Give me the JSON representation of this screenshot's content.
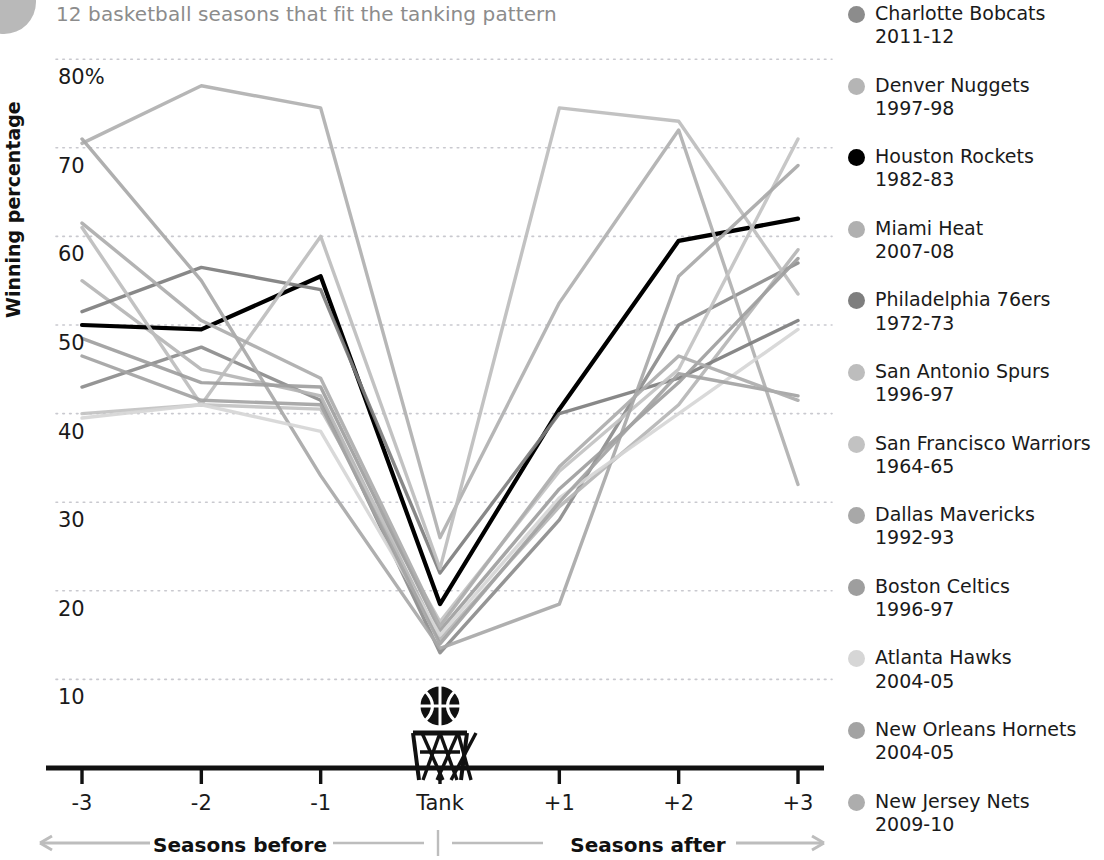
{
  "title": "12 basketball seasons that fit the tanking pattern",
  "axes": {
    "ylabel": "Winning percentage",
    "yticks": [
      "80%",
      "70",
      "60",
      "50",
      "40",
      "30",
      "20",
      "10"
    ],
    "ytick_values": [
      80,
      70,
      60,
      50,
      40,
      30,
      20,
      10
    ],
    "xticks": [
      "-3",
      "-2",
      "-1",
      "Tank",
      "+1",
      "+2",
      "+3"
    ],
    "caption_before": "Seasons before",
    "caption_after": "Seasons after"
  },
  "icons": {
    "basketball": "basketball-icon",
    "hoop": "basketball-hoop-icon",
    "arrow_left": "arrow-left-icon",
    "arrow_right": "arrow-right-icon"
  },
  "legend": {
    "items": [
      {
        "team": "Charlotte Bobcats",
        "season": "2011-12",
        "color": "#8c8c8c"
      },
      {
        "team": "Denver Nuggets",
        "season": "1997-98",
        "color": "#b5b5b5"
      },
      {
        "team": "Houston Rockets",
        "season": "1982-83",
        "color": "#000000"
      },
      {
        "team": "Miami Heat",
        "season": "2007-08",
        "color": "#b0b0b0"
      },
      {
        "team": "Philadelphia 76ers",
        "season": "1972-73",
        "color": "#7e7e7e"
      },
      {
        "team": "San Antonio Spurs",
        "season": "1996-97",
        "color": "#bdbdbd"
      },
      {
        "team": "San Francisco Warriors",
        "season": "1964-65",
        "color": "#c2c2c2"
      },
      {
        "team": "Dallas Mavericks",
        "season": "1992-93",
        "color": "#a8a8a8"
      },
      {
        "team": "Boston Celtics",
        "season": "1996-97",
        "color": "#9e9e9e"
      },
      {
        "team": "Atlanta Hawks",
        "season": "2004-05",
        "color": "#d6d6d6"
      },
      {
        "team": "New Orleans Hornets",
        "season": "2004-05",
        "color": "#a3a3a3"
      },
      {
        "team": "New Jersey Nets",
        "season": "2009-10",
        "color": "#adadad"
      }
    ]
  },
  "chart_data": {
    "type": "line",
    "title": "12 basketball seasons that fit the tanking pattern",
    "xlabel": "",
    "ylabel": "Winning percentage",
    "x": [
      "-3",
      "-2",
      "-1",
      "Tank",
      "+1",
      "+2",
      "+3"
    ],
    "ylim": [
      0,
      82
    ],
    "xlim": [
      -3,
      3
    ],
    "grid": "horizontal-dotted",
    "legend_position": "right",
    "highlight_series": "Houston Rockets 1982-83",
    "series": [
      {
        "name": "Charlotte Bobcats 2011-12",
        "color": "#8c8c8c",
        "values": [
          43.0,
          47.5,
          41.5,
          13.0,
          28.0,
          50.0,
          57.0
        ]
      },
      {
        "name": "Denver Nuggets 1997-98",
        "color": "#b5b5b5",
        "values": [
          55.0,
          45.0,
          42.0,
          14.5,
          29.5,
          41.0,
          58.5
        ]
      },
      {
        "name": "Houston Rockets 1982-83",
        "color": "#000000",
        "values": [
          50.0,
          49.5,
          55.5,
          18.5,
          40.5,
          59.5,
          62.0
        ]
      },
      {
        "name": "Miami Heat 2007-08",
        "color": "#b0b0b0",
        "values": [
          70.5,
          77.0,
          74.5,
          26.0,
          52.5,
          72.0,
          32.0
        ]
      },
      {
        "name": "Philadelphia 76ers 1972-73",
        "color": "#7e7e7e",
        "values": [
          51.5,
          56.5,
          54.0,
          22.0,
          40.0,
          44.0,
          50.5
        ]
      },
      {
        "name": "San Antonio Spurs 1996-97",
        "color": "#bdbdbd",
        "values": [
          61.0,
          41.0,
          60.0,
          22.5,
          74.5,
          73.0,
          53.5
        ]
      },
      {
        "name": "San Francisco Warriors 1964-65",
        "color": "#c2c2c2",
        "values": [
          40.0,
          41.0,
          40.5,
          16.5,
          33.5,
          45.0,
          71.0
        ]
      },
      {
        "name": "Dallas Mavericks 1992-93",
        "color": "#a8a8a8",
        "values": [
          71.0,
          55.0,
          33.0,
          13.5,
          18.5,
          55.5,
          68.0
        ]
      },
      {
        "name": "Boston Celtics 1996-97",
        "color": "#9e9e9e",
        "values": [
          48.5,
          43.5,
          43.0,
          15.5,
          31.5,
          43.5,
          57.5
        ]
      },
      {
        "name": "Atlanta Hawks 2004-05",
        "color": "#d6d6d6",
        "values": [
          39.5,
          41.0,
          38.0,
          15.0,
          30.5,
          40.0,
          49.5
        ]
      },
      {
        "name": "New Orleans Hornets 2004-05",
        "color": "#a3a3a3",
        "values": [
          46.5,
          41.5,
          41.0,
          14.0,
          30.0,
          44.5,
          42.0
        ]
      },
      {
        "name": "New Jersey Nets 2009-10",
        "color": "#adadad",
        "values": [
          61.5,
          50.5,
          44.0,
          16.0,
          34.0,
          46.5,
          41.5
        ]
      }
    ]
  }
}
